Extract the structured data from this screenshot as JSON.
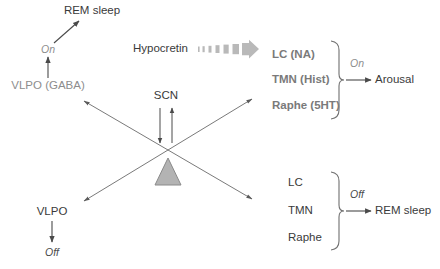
{
  "diagram": {
    "colors": {
      "text_dark": "#3a3a3a",
      "text_gray": "#8d8d8d",
      "text_midgray": "#7a7a7a",
      "line": "#5a5a5a",
      "line_gray": "#9a9a9a",
      "triangle_fill": "#b3b3b3",
      "triangle_stroke": "#8a8a8a",
      "hypocretin_arrow": "#b0b0b0"
    },
    "top_left_branch": {
      "outcome_label": "REM sleep",
      "state_label": "On",
      "source_label": "VLPO (GABA)"
    },
    "bottom_left_branch": {
      "source_label": "VLPO",
      "state_label": "Off"
    },
    "center": {
      "scn_label": "SCN",
      "fulcrum_name": "triangle-fulcrum"
    },
    "hypocretin": {
      "label": "Hypocretin",
      "arrow_name": "hypocretin-gradient-arrow"
    },
    "top_right_group": {
      "nuclei": [
        "LC (NA)",
        "TMN (Hist)",
        "Raphe (5HT)"
      ],
      "state_label": "On",
      "outcome_label": "Arousal"
    },
    "bottom_right_group": {
      "nuclei": [
        "LC",
        "TMN",
        "Raphe"
      ],
      "state_label": "Off",
      "outcome_label": "REM sleep"
    }
  }
}
